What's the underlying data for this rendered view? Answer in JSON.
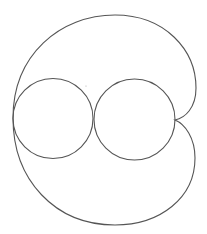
{
  "diagram": {
    "stroke_color": "#555555",
    "background": "#ffffff",
    "outer_curve": {
      "left_point": [
        13,
        118
      ],
      "top_point": [
        115,
        15
      ],
      "upper_right_extent": [
        196,
        88
      ],
      "cusp": [
        175,
        120
      ],
      "lower_right_extent": [
        195,
        158
      ],
      "bottom_point": [
        115,
        225
      ]
    },
    "circles": [
      {
        "name": "left-circle",
        "cx": 53,
        "cy": 118.5,
        "r": 40
      },
      {
        "name": "right-circle",
        "cx": 134.5,
        "cy": 119.5,
        "r": 40.5
      }
    ],
    "stray_dot": {
      "cx": 86,
      "cy": 86,
      "r": 0.6
    }
  }
}
